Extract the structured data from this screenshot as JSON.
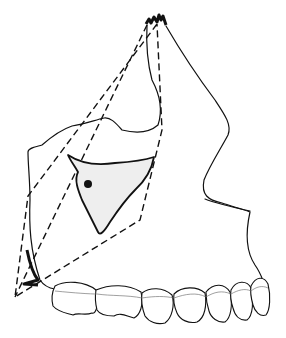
{
  "figure": {
    "elements": {
      "bone_outline": "maxilla-outline",
      "dashed_region": "dashed-quadrilateral",
      "sinus": "shaded-sinus-region",
      "marker": "dot-marker",
      "teeth_count": 8
    },
    "colors": {
      "line": "#111111",
      "background": "#ffffff",
      "sinus_fill": "#eeeeee",
      "cej_line": "#777777"
    }
  }
}
